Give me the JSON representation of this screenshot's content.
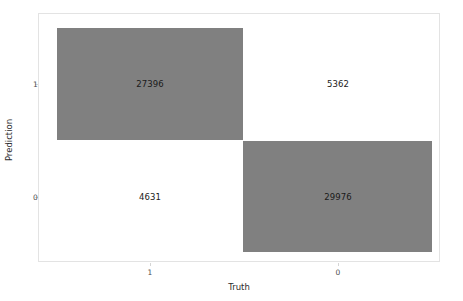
{
  "chart_data": {
    "type": "heatmap",
    "title": "",
    "subtitle": "",
    "xlabel": "Truth",
    "ylabel": "Prediction",
    "x_categories": [
      "1",
      "0"
    ],
    "y_categories": [
      "1",
      "0"
    ],
    "legend": "none",
    "grid": false,
    "cells": [
      {
        "x": "1",
        "y": "1",
        "value": "27396",
        "filled": true,
        "fill": "#808080"
      },
      {
        "x": "0",
        "y": "1",
        "value": "5362",
        "filled": false,
        "fill": "#ffffff"
      },
      {
        "x": "1",
        "y": "0",
        "value": "4631",
        "filled": false,
        "fill": "#ffffff"
      },
      {
        "x": "0",
        "y": "0",
        "value": "29976",
        "filled": true,
        "fill": "#808080"
      }
    ],
    "matrix": [
      [
        27396,
        5362
      ],
      [
        4631,
        29976
      ]
    ],
    "colors": {
      "fill_gray": "#808080",
      "background": "#ffffff",
      "panel_border": "#e3e3e3",
      "text": "#1a1a1a",
      "tick_text": "#4d4d4d"
    }
  },
  "axes": {
    "y": {
      "title": "Prediction",
      "ticks": [
        {
          "label": "1"
        },
        {
          "label": "0"
        }
      ]
    },
    "x": {
      "title": "Truth",
      "ticks": [
        {
          "label": "1"
        },
        {
          "label": "0"
        }
      ]
    }
  }
}
